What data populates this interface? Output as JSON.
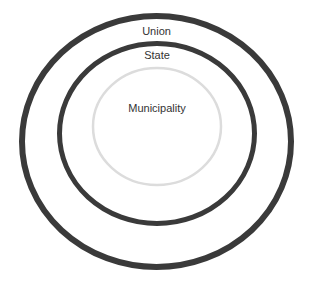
{
  "diagram": {
    "type": "nested-circles",
    "colors": {
      "outer_ring": "#3a3a3a",
      "state_ring": "#3a3a3a",
      "inner_ring": "#dcdcdc",
      "text": "#333333",
      "background": "#ffffff"
    },
    "circles": [
      {
        "label": "Union",
        "level": 1
      },
      {
        "label": "State",
        "level": 2
      },
      {
        "label": "Municipality",
        "level": 3
      }
    ]
  }
}
